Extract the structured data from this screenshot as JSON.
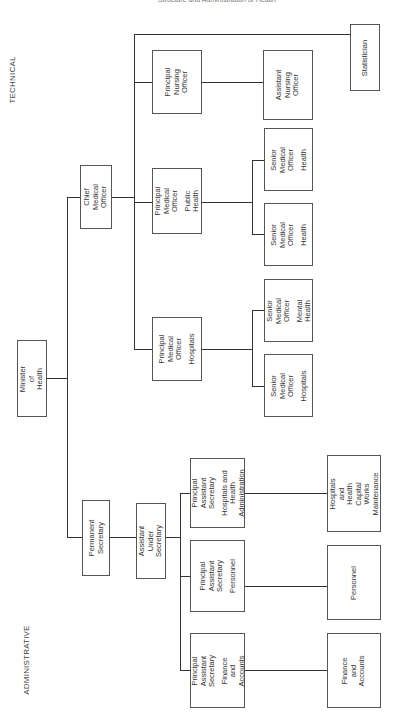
{
  "header": {
    "cut_text": "Structure and Administration of Health"
  },
  "sections": {
    "technical": "TECHNICAL",
    "administrative": "ADMINISTRATIVE"
  },
  "nodes": {
    "minister": {
      "title": "Minister of\nHealth"
    },
    "chief_medical_officer": {
      "title": "Chief Medical\nOfficer"
    },
    "permanent_secretary": {
      "title": "Permanent\nSecretary"
    },
    "assistant_under_secretary": {
      "title": "Assistant  Under\nSecretary"
    },
    "principal_nursing_officer": {
      "title": "Principal\nNursing\nOfficer"
    },
    "pmo_public_health": {
      "title": "Principal\nMedical\nOfficer",
      "sub": "Public Health"
    },
    "pmo_hospitals": {
      "title": "Principal\nMedical\nOfficer",
      "sub": "Hospitals"
    },
    "assistant_nursing_officer": {
      "title": "Assistant\nNursing\nOfficer"
    },
    "smo_health_1": {
      "title": "Senior Medical\nOfficer",
      "sub": "Health"
    },
    "smo_health_2": {
      "title": "Senior Medical\nOfficer",
      "sub": "Health"
    },
    "smo_mental_health": {
      "title": "Senior Medical\nOfficer",
      "sub": "Mental Health"
    },
    "smo_hospitals": {
      "title": "Senior Medical\nOfficer",
      "sub": "Hospitals"
    },
    "statistician": {
      "title": "Statistician"
    },
    "pas_hospitals_admin": {
      "title": "Principal\nAssistant\nSecretary",
      "sub": "Hospitals and Health\nAdministration"
    },
    "pas_personnel": {
      "title": "Principal\nAssistant\nSecretary",
      "sub": "Personnel"
    },
    "pas_finance": {
      "title": "Principal\nAssistant\nSecretary",
      "sub": "Finance and\nAccounts"
    },
    "capital_works": {
      "title": "Hospitals and\nHealth\nCapital\nWorks\nMaintenance"
    },
    "personnel": {
      "title": "Personnel"
    },
    "finance_accounts": {
      "title": "Finance and\nAccounts"
    }
  }
}
